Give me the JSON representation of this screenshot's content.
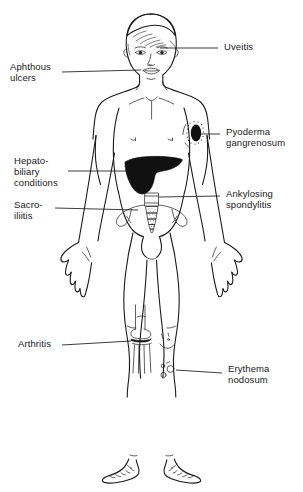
{
  "figure": {
    "background_color": "#ffffff",
    "line_color": "#1a1a1a",
    "lesion_fill_color": "#111111"
  },
  "labels": [
    {
      "id": "uveitis",
      "text": "Uveitis",
      "side": "right",
      "target": "left eye",
      "x": 224,
      "y": 44
    },
    {
      "id": "aphthous-ulcers",
      "text": "Aphthous\nulcers",
      "side": "left",
      "target": "mouth",
      "x": 10,
      "y": 62
    },
    {
      "id": "pyoderma-gangrenosum",
      "text": "Pyoderma\ngangrenosum",
      "side": "right",
      "target": "left upper arm / shoulder skin lesion",
      "x": 226,
      "y": 126
    },
    {
      "id": "hepatobiliary-conditions",
      "text": "Hepato-\nbiliary\nconditions",
      "side": "left",
      "target": "liver",
      "x": 14,
      "y": 156
    },
    {
      "id": "ankylosing-spondylitis",
      "text": "Ankylosing\nspondylitis",
      "side": "right",
      "target": "lumbar spine",
      "x": 226,
      "y": 188
    },
    {
      "id": "sacroiliitis",
      "text": "Sacro-\niliitis",
      "side": "left",
      "target": "sacroiliac joint",
      "x": 14,
      "y": 198
    },
    {
      "id": "arthritis",
      "text": "Arthritis",
      "side": "left",
      "target": "right knee joint",
      "x": 18,
      "y": 338
    },
    {
      "id": "erythema-nodosum",
      "text": "Erythema\nnodosum",
      "side": "right",
      "target": "left shin nodules",
      "x": 228,
      "y": 362
    }
  ],
  "leader_lines": [
    {
      "id": "uveitis",
      "x1": 218,
      "y1": 48,
      "x2": 160,
      "y2": 48
    },
    {
      "id": "aphthous-ulcers",
      "x1": 62,
      "y1": 72,
      "x2": 141,
      "y2": 70
    },
    {
      "id": "pyoderma-gangrenosum",
      "x1": 220,
      "y1": 134,
      "x2": 198,
      "y2": 134
    },
    {
      "id": "hepatobiliary-conditions",
      "x1": 68,
      "y1": 171,
      "x2": 129,
      "y2": 171
    },
    {
      "id": "ankylosing-spondylitis",
      "x1": 220,
      "y1": 196,
      "x2": 160,
      "y2": 196
    },
    {
      "id": "sacroiliitis",
      "x1": 55,
      "y1": 208,
      "x2": 138,
      "y2": 208
    },
    {
      "id": "arthritis",
      "x1": 62,
      "y1": 345,
      "x2": 131,
      "y2": 345
    },
    {
      "id": "erythema-nodosum",
      "x1": 222,
      "y1": 373,
      "x2": 178,
      "y2": 373
    }
  ],
  "anatomy_markers": [
    {
      "id": "liver",
      "type": "filled-organ",
      "description": "solid black liver silhouette in right upper abdomen"
    },
    {
      "id": "pyoderma-lesion",
      "type": "filled-lesion",
      "description": "black oval ulcer with stippled halo on left shoulder"
    },
    {
      "id": "pelvis-sacrum",
      "type": "outline-bone",
      "description": "pelvis with lumbar vertebrae and stippled sacrum"
    },
    {
      "id": "knee-joint",
      "type": "outline-bone",
      "description": "femur and tibia with darkened joint space"
    },
    {
      "id": "erythema-nodules",
      "type": "outline-lesion",
      "description": "small circular nodules on left shin"
    }
  ]
}
